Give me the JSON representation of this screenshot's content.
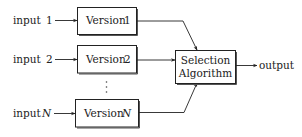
{
  "diagram": {
    "type": "block-diagram",
    "title": "",
    "inputs": [
      {
        "label": "input",
        "index": "1"
      },
      {
        "label": "input",
        "index": "2"
      },
      {
        "label": "input",
        "index": "N"
      }
    ],
    "versions": [
      {
        "label": "Version",
        "index": "1"
      },
      {
        "label": "Version",
        "index": "2"
      },
      {
        "label": "Version",
        "index": "N"
      }
    ],
    "ellipsis": "⋮",
    "selector": {
      "line1": "Selection",
      "line2": "Algorithm"
    },
    "output": {
      "label": "output"
    },
    "edges": [
      {
        "from": "input 1",
        "to": "Version 1"
      },
      {
        "from": "input 2",
        "to": "Version 2"
      },
      {
        "from": "input N",
        "to": "Version N"
      },
      {
        "from": "Version 1",
        "to": "Selection Algorithm"
      },
      {
        "from": "Version 2",
        "to": "Selection Algorithm"
      },
      {
        "from": "Version N",
        "to": "Selection Algorithm"
      },
      {
        "from": "Selection Algorithm",
        "to": "output"
      }
    ],
    "colors": {
      "stroke": "#222222",
      "background": "#ffffff"
    }
  }
}
